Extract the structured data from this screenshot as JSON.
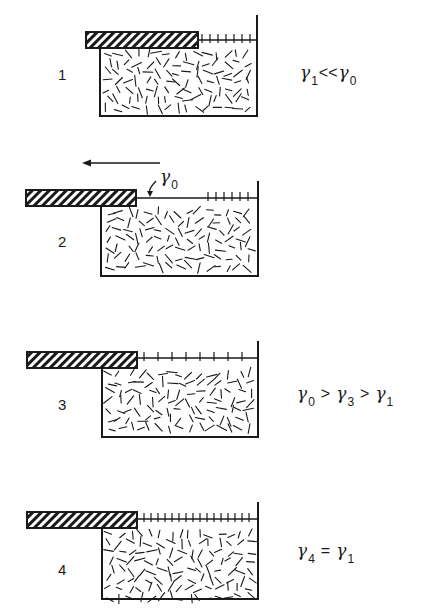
{
  "figure": {
    "panels": [
      {
        "label": "1",
        "barrier": {
          "x": 86,
          "y": 32,
          "w": 112,
          "h": 16
        },
        "trough": {
          "left": 100,
          "right": 257,
          "top": 48,
          "bottom": 116,
          "wall_top": 15
        },
        "surface_y": 40,
        "film": {
          "from": 198,
          "to": 257,
          "spacing": 8
        },
        "relation": {
          "parts": [
            {
              "sym": "γ",
              "sub": "1"
            },
            {
              "op": "<<",
              "tight": true
            },
            {
              "sym": "γ",
              "sub": "0"
            }
          ]
        },
        "relation_pos": {
          "x": 300,
          "y": 62
        },
        "label_pos": {
          "x": 58,
          "y": 66
        }
      },
      {
        "label": "2",
        "barrier": {
          "x": 26,
          "y": 190,
          "w": 110,
          "h": 16
        },
        "trough": {
          "left": 101,
          "right": 258,
          "top": 206,
          "bottom": 276,
          "wall_top": 181
        },
        "surface_y": 198,
        "film": {
          "from": 204,
          "to": 258,
          "spacing": 8
        },
        "arrow": {
          "x1": 160,
          "x2": 82,
          "y": 163,
          "label": "direction of barrier movement"
        },
        "annotation": {
          "sym": "γ",
          "sub": "0",
          "x": 160,
          "y": 166,
          "pointer": {
            "x1": 156,
            "y1": 181,
            "x2": 150,
            "y2": 197
          }
        },
        "label_pos": {
          "x": 58,
          "y": 233
        }
      },
      {
        "label": "3",
        "barrier": {
          "x": 27,
          "y": 352,
          "w": 110,
          "h": 16
        },
        "trough": {
          "left": 102,
          "right": 258,
          "top": 368,
          "bottom": 437,
          "wall_top": 341
        },
        "surface_y": 358,
        "film": {
          "from": 140,
          "to": 258,
          "spacing": 14
        },
        "relation": {
          "parts": [
            {
              "sym": "γ",
              "sub": "0"
            },
            {
              "op": ">"
            },
            {
              "sym": "γ",
              "sub": "3"
            },
            {
              "op": ">"
            },
            {
              "sym": "γ",
              "sub": "1"
            }
          ]
        },
        "relation_pos": {
          "x": 297,
          "y": 383
        },
        "label_pos": {
          "x": 58,
          "y": 396
        }
      },
      {
        "label": "4",
        "barrier": {
          "x": 27,
          "y": 512,
          "w": 110,
          "h": 16
        },
        "trough": {
          "left": 102,
          "right": 258,
          "top": 528,
          "bottom": 599,
          "wall_top": 502
        },
        "surface_y": 519,
        "film": {
          "from": 140,
          "to": 258,
          "spacing": 7
        },
        "relation": {
          "parts": [
            {
              "sym": "γ",
              "sub": "4"
            },
            {
              "op": "="
            },
            {
              "sym": "γ",
              "sub": "1"
            }
          ]
        },
        "relation_pos": {
          "x": 297,
          "y": 540
        },
        "label_pos": {
          "x": 58,
          "y": 561
        }
      }
    ]
  },
  "colors": {
    "ink": "#1a1a1a",
    "background": "#ffffff"
  }
}
